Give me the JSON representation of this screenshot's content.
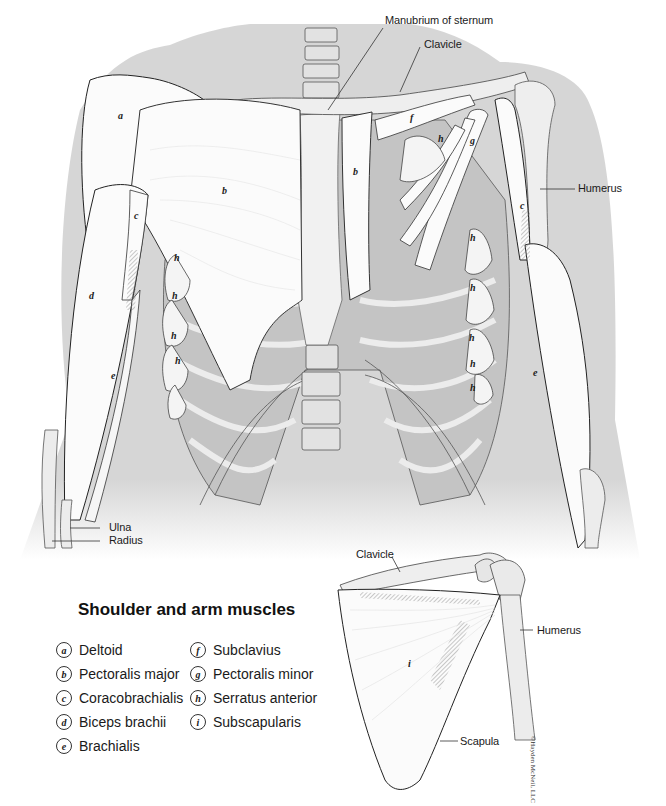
{
  "figure": {
    "title": "Shoulder and arm muscles",
    "copyright": "©Hayden McNeil, LLC",
    "colors": {
      "body_silhouette": "#d6d6d6",
      "muscle_fill": "#fbfbfb",
      "bone_fill": "#ececec",
      "rib_shadow": "#bdbdbd",
      "outline": "#2a2a2a",
      "leader_line": "#333333"
    }
  },
  "main_illustration": {
    "structure_labels": [
      {
        "id": "manubrium",
        "text": "Manubrium of sternum"
      },
      {
        "id": "clavicle",
        "text": "Clavicle"
      },
      {
        "id": "humerus",
        "text": "Humerus"
      },
      {
        "id": "ulna",
        "text": "Ulna"
      },
      {
        "id": "radius",
        "text": "Radius"
      }
    ],
    "muscle_markers": [
      "a",
      "b",
      "b",
      "c",
      "c",
      "d",
      "e",
      "e",
      "f",
      "g",
      "h",
      "h",
      "h",
      "h",
      "h",
      "h",
      "h",
      "h",
      "h",
      "h"
    ]
  },
  "scapula_inset": {
    "structure_labels": [
      {
        "id": "clavicle",
        "text": "Clavicle"
      },
      {
        "id": "humerus",
        "text": "Humerus"
      },
      {
        "id": "scapula",
        "text": "Scapula"
      }
    ],
    "muscle_markers": [
      "i"
    ]
  },
  "legend": {
    "items": [
      {
        "letter": "a",
        "name": "Deltoid"
      },
      {
        "letter": "b",
        "name": "Pectoralis major"
      },
      {
        "letter": "c",
        "name": "Coracobrachialis"
      },
      {
        "letter": "d",
        "name": "Biceps brachii"
      },
      {
        "letter": "e",
        "name": "Brachialis"
      },
      {
        "letter": "f",
        "name": "Subclavius"
      },
      {
        "letter": "g",
        "name": "Pectoralis minor"
      },
      {
        "letter": "h",
        "name": "Serratus anterior"
      },
      {
        "letter": "i",
        "name": "Subscapularis"
      }
    ]
  }
}
